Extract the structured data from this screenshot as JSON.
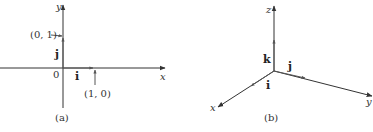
{
  "panels": [
    {
      "caption": "(a)",
      "axes": {
        "x_label": "x",
        "y_label": "y"
      },
      "origin_label": "0",
      "vectors": [
        {
          "name": "i",
          "label": "i",
          "endpoint_label": "(1, 0)"
        },
        {
          "name": "j",
          "label": "j",
          "endpoint_label": "(0, 1)"
        }
      ]
    },
    {
      "caption": "(b)",
      "axes": {
        "x_label": "x",
        "y_label": "y",
        "z_label": "z"
      },
      "vectors": [
        {
          "name": "i",
          "label": "i"
        },
        {
          "name": "j",
          "label": "j"
        },
        {
          "name": "k",
          "label": "k"
        }
      ]
    }
  ]
}
